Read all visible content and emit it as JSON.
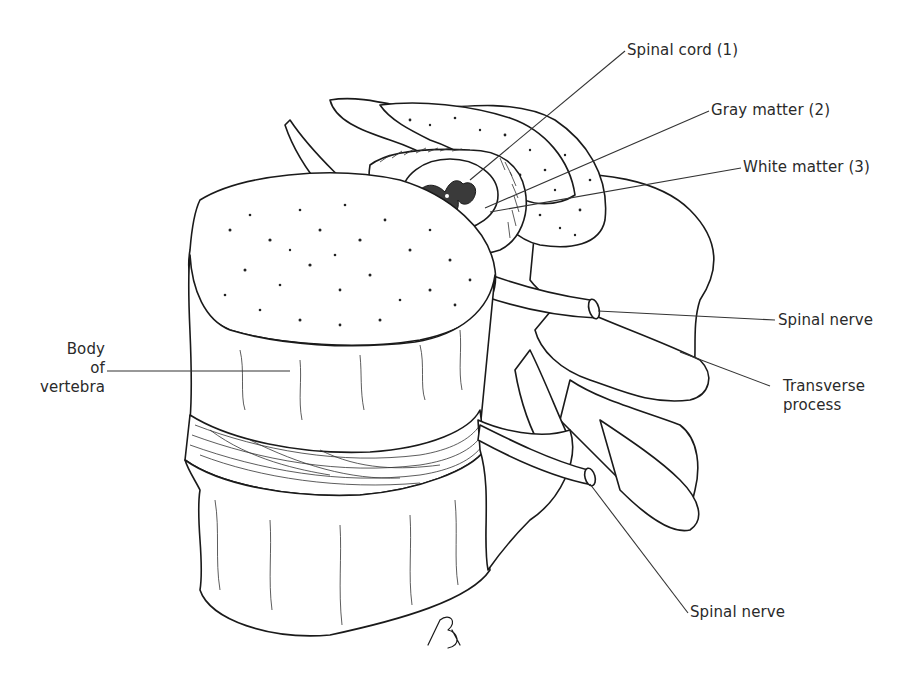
{
  "figure": {
    "labels": {
      "spinal_cord": "Spinal cord (1)",
      "gray_matter": "Gray matter (2)",
      "white_matter": "White matter (3)",
      "spinal_nerve_upper": "Spinal nerve",
      "transverse_process": [
        "Transverse",
        "process"
      ],
      "spinal_nerve_lower": "Spinal nerve",
      "body_of_vertebra": [
        "Body",
        "of",
        "vertebra"
      ]
    },
    "signature": "RB"
  },
  "colors": {
    "ink": "#1a1a1a",
    "label_text": "#2a2a2a",
    "background": "#ffffff"
  }
}
